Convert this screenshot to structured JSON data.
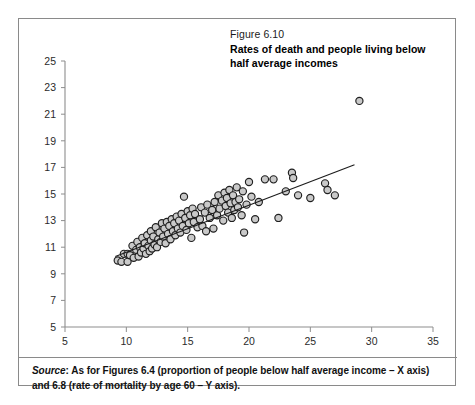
{
  "figure": {
    "number": "Figure 6.10",
    "title": "Rates of death and people living below half average incomes",
    "source_label": "Source",
    "source_text": ": As for Figures 6.4 (proportion of people below half average income – X axis) and 6.8 (rate of mortality by age 60 – Y axis)."
  },
  "colors": {
    "marker_fill": "#c9c9c9",
    "marker_stroke": "#1f1f1f",
    "axis": "#8d8d8d",
    "trend": "#1c1c1c",
    "frame": "#8a8a8a"
  },
  "chart_data": {
    "type": "scatter",
    "title": "Rates of death and people living below half average incomes",
    "xlabel": "Proportion of people below half average income",
    "ylabel": "Rate of mortality by age 60",
    "xlim": [
      5,
      35
    ],
    "ylim": [
      5,
      25
    ],
    "xticks": [
      5,
      10,
      15,
      20,
      25,
      30,
      35
    ],
    "yticks": [
      5,
      7,
      9,
      11,
      13,
      15,
      17,
      19,
      21,
      23,
      25
    ],
    "grid": false,
    "legend": false,
    "trendline": {
      "type": "linear",
      "x": [
        9.1,
        28.6
      ],
      "y": [
        10.3,
        17.2
      ]
    },
    "points": [
      [
        9.3,
        10.0
      ],
      [
        9.6,
        9.9
      ],
      [
        9.8,
        10.5
      ],
      [
        10.1,
        10.5
      ],
      [
        10.1,
        9.9
      ],
      [
        10.3,
        10.4
      ],
      [
        10.5,
        11.1
      ],
      [
        10.6,
        10.2
      ],
      [
        10.8,
        10.8
      ],
      [
        10.9,
        11.4
      ],
      [
        11.0,
        10.3
      ],
      [
        11.1,
        11.0
      ],
      [
        11.2,
        10.6
      ],
      [
        11.3,
        11.7
      ],
      [
        11.4,
        10.9
      ],
      [
        11.5,
        11.3
      ],
      [
        11.6,
        10.5
      ],
      [
        11.7,
        11.9
      ],
      [
        11.8,
        11.1
      ],
      [
        11.9,
        10.7
      ],
      [
        12.0,
        11.5
      ],
      [
        12.0,
        12.2
      ],
      [
        12.1,
        10.9
      ],
      [
        12.2,
        11.8
      ],
      [
        12.3,
        11.2
      ],
      [
        12.4,
        12.5
      ],
      [
        12.5,
        11.0
      ],
      [
        12.6,
        11.6
      ],
      [
        12.7,
        12.1
      ],
      [
        12.8,
        11.4
      ],
      [
        12.9,
        12.8
      ],
      [
        13.0,
        11.8
      ],
      [
        13.1,
        12.4
      ],
      [
        13.2,
        11.3
      ],
      [
        13.3,
        12.9
      ],
      [
        13.4,
        12.0
      ],
      [
        13.5,
        12.6
      ],
      [
        13.6,
        11.6
      ],
      [
        13.7,
        13.1
      ],
      [
        13.8,
        12.2
      ],
      [
        13.9,
        12.8
      ],
      [
        14.0,
        11.9
      ],
      [
        14.1,
        13.3
      ],
      [
        14.2,
        12.4
      ],
      [
        14.3,
        13.0
      ],
      [
        14.4,
        12.1
      ],
      [
        14.5,
        13.5
      ],
      [
        14.6,
        12.6
      ],
      [
        14.7,
        14.8
      ],
      [
        14.8,
        13.2
      ],
      [
        14.9,
        12.3
      ],
      [
        15.0,
        13.7
      ],
      [
        15.1,
        12.8
      ],
      [
        15.2,
        13.4
      ],
      [
        15.3,
        11.7
      ],
      [
        15.4,
        13.9
      ],
      [
        15.5,
        12.9
      ],
      [
        15.6,
        13.5
      ],
      [
        15.8,
        12.5
      ],
      [
        16.0,
        13.1
      ],
      [
        16.1,
        14.0
      ],
      [
        16.2,
        12.6
      ],
      [
        16.4,
        13.6
      ],
      [
        16.5,
        12.2
      ],
      [
        16.6,
        14.2
      ],
      [
        16.8,
        13.2
      ],
      [
        17.0,
        13.8
      ],
      [
        17.1,
        12.4
      ],
      [
        17.2,
        14.4
      ],
      [
        17.4,
        13.4
      ],
      [
        17.5,
        14.9
      ],
      [
        17.6,
        13.9
      ],
      [
        17.8,
        14.5
      ],
      [
        17.9,
        13.0
      ],
      [
        18.0,
        15.1
      ],
      [
        18.1,
        14.1
      ],
      [
        18.2,
        14.7
      ],
      [
        18.3,
        13.6
      ],
      [
        18.4,
        15.3
      ],
      [
        18.5,
        14.3
      ],
      [
        18.6,
        13.2
      ],
      [
        18.7,
        14.9
      ],
      [
        18.8,
        13.8
      ],
      [
        18.9,
        14.4
      ],
      [
        19.0,
        15.5
      ],
      [
        19.1,
        14.0
      ],
      [
        19.2,
        14.6
      ],
      [
        19.4,
        13.4
      ],
      [
        19.5,
        15.2
      ],
      [
        19.6,
        12.1
      ],
      [
        19.8,
        14.2
      ],
      [
        20.0,
        15.9
      ],
      [
        20.2,
        14.8
      ],
      [
        20.5,
        13.1
      ],
      [
        20.8,
        14.4
      ],
      [
        21.3,
        16.1
      ],
      [
        22.0,
        16.1
      ],
      [
        22.4,
        13.2
      ],
      [
        23.0,
        15.2
      ],
      [
        23.5,
        16.6
      ],
      [
        23.6,
        16.2
      ],
      [
        24.0,
        14.9
      ],
      [
        25.0,
        14.7
      ],
      [
        26.2,
        15.8
      ],
      [
        26.4,
        15.3
      ],
      [
        27.0,
        14.9
      ],
      [
        29.0,
        22.0
      ]
    ]
  }
}
